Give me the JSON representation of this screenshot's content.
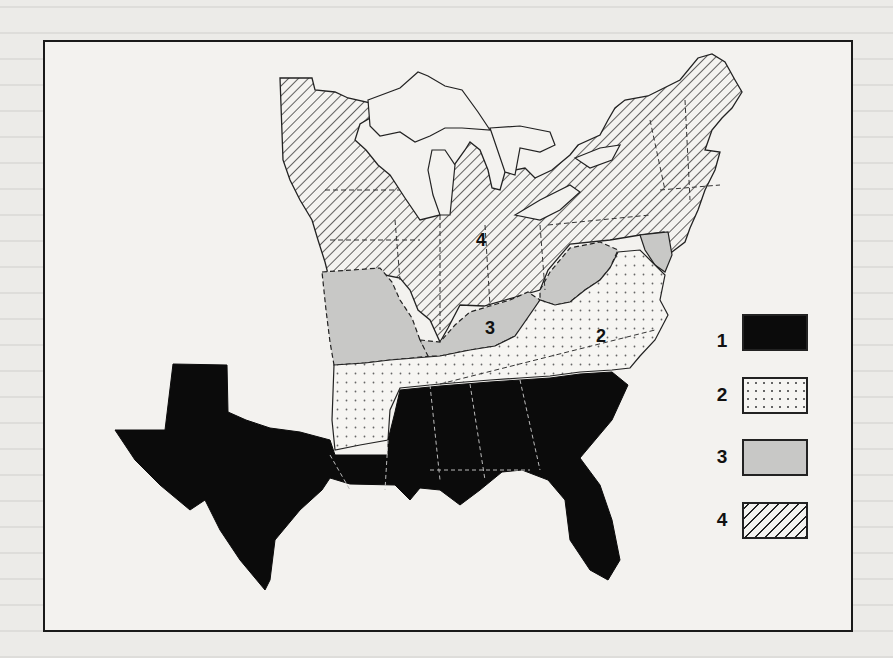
{
  "figure": {
    "type": "choropleth-map"
  },
  "map": {
    "region_labels": [
      {
        "id": "4",
        "text": "4",
        "x": 476,
        "y": 242
      },
      {
        "id": "3",
        "text": "3",
        "x": 485,
        "y": 330
      },
      {
        "id": "2",
        "text": "2",
        "x": 596,
        "y": 336
      }
    ]
  },
  "legend": {
    "items": [
      {
        "label": "1",
        "pattern": "solid-black",
        "color": "#0b0b0b"
      },
      {
        "label": "2",
        "pattern": "dotted",
        "color": "#f6f5f2"
      },
      {
        "label": "3",
        "pattern": "light-gray",
        "color": "#c8c8c6"
      },
      {
        "label": "4",
        "pattern": "diagonal-hatch",
        "color": "#f4f3f0"
      }
    ]
  },
  "categories": {
    "1": [
      "Texas",
      "Louisiana",
      "Mississippi",
      "Alabama",
      "Georgia",
      "South Carolina",
      "Florida"
    ],
    "2": [
      "Arkansas",
      "Tennessee",
      "North Carolina",
      "Virginia"
    ],
    "3": [
      "Missouri",
      "Kentucky",
      "West Virginia",
      "Maryland",
      "Delaware"
    ],
    "4": [
      "Minnesota",
      "Wisconsin",
      "Michigan",
      "Iowa",
      "Illinois",
      "Indiana",
      "Ohio",
      "Pennsylvania",
      "New York",
      "New Jersey",
      "Connecticut",
      "Rhode Island",
      "Massachusetts",
      "Vermont",
      "New Hampshire",
      "Maine"
    ]
  }
}
